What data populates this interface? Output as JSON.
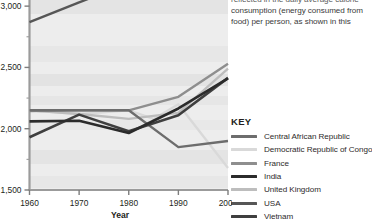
{
  "article": {
    "paragraph_lines": [
      "reflected in the daily average calorie",
      "consumption (energy consumed from",
      "food) per person, as shown in this"
    ]
  },
  "key": {
    "title": "KEY",
    "entries": [
      {
        "label": "Central African Republic",
        "color": "#6d6d6d"
      },
      {
        "label": "Democratic Republic of Congo",
        "color": "#d9d9d9"
      },
      {
        "label": "France",
        "color": "#8e8e8e"
      },
      {
        "label": "India",
        "color": "#2b2b2b"
      },
      {
        "label": "United Kingdom",
        "color": "#bdbdbd"
      },
      {
        "label": "USA",
        "color": "#565656"
      },
      {
        "label": "Vietnam",
        "color": "#3f3f3f"
      }
    ]
  },
  "chart_data": {
    "type": "line",
    "title": "",
    "xlabel": "Year",
    "ylabel": "",
    "x": [
      1960,
      1970,
      1980,
      1990,
      2000
    ],
    "xlim": [
      1960,
      2000
    ],
    "ylim": [
      1500,
      3150
    ],
    "xticks": [
      "1960",
      "1970",
      "1980",
      "1990",
      "2000"
    ],
    "yticks": [
      "1,500",
      "2,000",
      "2,500",
      "3,000"
    ],
    "ytick_values": [
      1500,
      2000,
      2500,
      3000
    ],
    "yminor_values": [
      1750,
      2250,
      2750
    ],
    "grid": false,
    "legend_position": "right",
    "series": [
      {
        "name": "USA",
        "color": "#565656",
        "x": [
          1960,
          1970,
          1980
        ],
        "values": [
          2870,
          3030,
          3190
        ]
      },
      {
        "name": "France",
        "color": "#8e8e8e",
        "x": [
          1960,
          1970,
          1980,
          1990,
          2000
        ],
        "values": [
          2145,
          2150,
          2150,
          2260,
          2530
        ]
      },
      {
        "name": "United Kingdom",
        "color": "#bdbdbd",
        "x": [
          1960,
          1970,
          1980,
          1990,
          2000
        ],
        "values": [
          2150,
          2120,
          2080,
          2130,
          2490
        ]
      },
      {
        "name": "India",
        "color": "#2b2b2b",
        "x": [
          1960,
          1970,
          1980,
          1990,
          2000
        ],
        "values": [
          2060,
          2065,
          1965,
          2165,
          2410
        ]
      },
      {
        "name": "Vietnam",
        "color": "#3f3f3f",
        "x": [
          1960,
          1970,
          1980,
          1990,
          2000
        ],
        "values": [
          1930,
          2115,
          1980,
          2110,
          2415
        ]
      },
      {
        "name": "Central African Republic",
        "color": "#6d6d6d",
        "x": [
          1960,
          1970,
          1980,
          1990,
          2000
        ],
        "values": [
          2150,
          2150,
          2150,
          1850,
          1900
        ]
      },
      {
        "name": "Democratic Republic of Congo",
        "color": "#d9d9d9",
        "x": [
          1960,
          1970,
          1980,
          1985,
          1990,
          2000
        ],
        "values": [
          2150,
          2120,
          2150,
          2080,
          2200,
          1680
        ]
      }
    ]
  }
}
